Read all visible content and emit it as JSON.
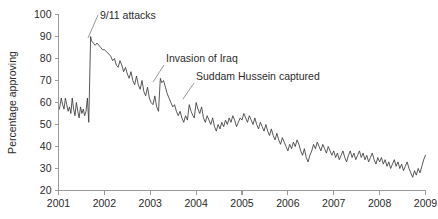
{
  "figure": {
    "width": 438,
    "height": 219,
    "background": "#ffffff"
  },
  "chart_data": {
    "type": "line",
    "title": "",
    "xlabel": "",
    "ylabel": "Percentage approving",
    "xlim": [
      2001.0,
      2009.0
    ],
    "ylim": [
      20,
      100
    ],
    "grid": false,
    "legend": null,
    "line_color": "#3b3b3b",
    "axis_color": "#9a9a9a",
    "text_color": "#2b2b2b",
    "y_ticks": [
      20,
      30,
      40,
      50,
      60,
      70,
      80,
      90,
      100
    ],
    "y_tick_labels": [
      "20",
      "30",
      "40",
      "50",
      "60",
      "70",
      "80",
      "90",
      "100"
    ],
    "x_ticks": [
      2001,
      2002,
      2003,
      2004,
      2005,
      2006,
      2007,
      2008,
      2009
    ],
    "x_tick_labels": [
      "2001",
      "2002",
      "2003",
      "2004",
      "2005",
      "2006",
      "2007",
      "2008",
      "2009"
    ],
    "annotations": [
      {
        "id": "sept-eleven",
        "label": "9/11 attacks",
        "text_x": 100,
        "text_y": 19,
        "leader": [
          [
            98,
            15
          ],
          [
            88,
            38
          ]
        ]
      },
      {
        "id": "invasion-of-iraq",
        "label": "Invasion of Iraq",
        "text_x": 166,
        "text_y": 62,
        "leader": [
          [
            164,
            65
          ],
          [
            153,
            82
          ]
        ]
      },
      {
        "id": "saddam-captured",
        "label": "Suddam Hussein captured",
        "text_x": 196,
        "text_y": 80,
        "leader": [
          [
            194,
            83
          ],
          [
            183,
            99
          ]
        ]
      }
    ],
    "series": [
      {
        "name": "Presidential approval",
        "x": [
          2001.02,
          2001.06,
          2001.09,
          2001.12,
          2001.15,
          2001.18,
          2001.21,
          2001.24,
          2001.27,
          2001.3,
          2001.33,
          2001.36,
          2001.39,
          2001.42,
          2001.45,
          2001.48,
          2001.51,
          2001.54,
          2001.57,
          2001.6,
          2001.63,
          2001.66,
          2001.7,
          2001.72,
          2001.76,
          2001.8,
          2001.84,
          2001.88,
          2001.92,
          2001.96,
          2002.0,
          2002.05,
          2002.1,
          2002.14,
          2002.18,
          2002.22,
          2002.26,
          2002.3,
          2002.34,
          2002.38,
          2002.42,
          2002.46,
          2002.5,
          2002.54,
          2002.58,
          2002.62,
          2002.66,
          2002.7,
          2002.74,
          2002.78,
          2002.82,
          2002.86,
          2002.9,
          2002.94,
          2002.98,
          2003.02,
          2003.06,
          2003.1,
          2003.14,
          2003.18,
          2003.22,
          2003.25,
          2003.29,
          2003.33,
          2003.37,
          2003.41,
          2003.45,
          2003.49,
          2003.53,
          2003.57,
          2003.61,
          2003.65,
          2003.69,
          2003.73,
          2003.77,
          2003.81,
          2003.85,
          2003.89,
          2003.93,
          2003.96,
          2004.0,
          2004.04,
          2004.08,
          2004.12,
          2004.16,
          2004.2,
          2004.24,
          2004.28,
          2004.32,
          2004.36,
          2004.4,
          2004.44,
          2004.48,
          2004.52,
          2004.56,
          2004.6,
          2004.64,
          2004.68,
          2004.72,
          2004.76,
          2004.8,
          2004.84,
          2004.88,
          2004.92,
          2004.96,
          2005.0,
          2005.04,
          2005.08,
          2005.12,
          2005.16,
          2005.2,
          2005.24,
          2005.28,
          2005.32,
          2005.36,
          2005.4,
          2005.44,
          2005.48,
          2005.52,
          2005.56,
          2005.6,
          2005.64,
          2005.68,
          2005.72,
          2005.76,
          2005.8,
          2005.84,
          2005.88,
          2005.92,
          2005.96,
          2006.0,
          2006.04,
          2006.08,
          2006.12,
          2006.16,
          2006.2,
          2006.24,
          2006.28,
          2006.32,
          2006.36,
          2006.4,
          2006.44,
          2006.48,
          2006.52,
          2006.56,
          2006.6,
          2006.64,
          2006.68,
          2006.72,
          2006.76,
          2006.8,
          2006.84,
          2006.88,
          2006.92,
          2006.96,
          2007.0,
          2007.04,
          2007.08,
          2007.12,
          2007.16,
          2007.2,
          2007.24,
          2007.28,
          2007.32,
          2007.36,
          2007.4,
          2007.44,
          2007.48,
          2007.52,
          2007.56,
          2007.6,
          2007.64,
          2007.68,
          2007.72,
          2007.76,
          2007.8,
          2007.84,
          2007.88,
          2007.92,
          2007.96,
          2008.0,
          2008.04,
          2008.08,
          2008.12,
          2008.16,
          2008.2,
          2008.24,
          2008.28,
          2008.32,
          2008.36,
          2008.4,
          2008.44,
          2008.48,
          2008.52,
          2008.56,
          2008.6,
          2008.64,
          2008.68,
          2008.72,
          2008.76,
          2008.8,
          2008.84,
          2008.88,
          2008.92,
          2008.96,
          2009.0
        ],
        "y": [
          57,
          62,
          59,
          57,
          62,
          59,
          56,
          58,
          55,
          62,
          57,
          54,
          60,
          56,
          53,
          58,
          55,
          57,
          54,
          56,
          62,
          51,
          90,
          88,
          87,
          86,
          87,
          86,
          85,
          84,
          84,
          83,
          82,
          81,
          79,
          80,
          77,
          76,
          79,
          77,
          74,
          76,
          73,
          71,
          74,
          70,
          68,
          72,
          68,
          66,
          70,
          65,
          63,
          67,
          62,
          60,
          59,
          63,
          58,
          56,
          71,
          69,
          70,
          67,
          64,
          62,
          60,
          58,
          59,
          56,
          54,
          56,
          53,
          51,
          54,
          52,
          59,
          56,
          54,
          53,
          60,
          57,
          55,
          58,
          53,
          51,
          54,
          52,
          50,
          53,
          49,
          47,
          50,
          48,
          51,
          49,
          52,
          50,
          53,
          51,
          54,
          52,
          49,
          51,
          53,
          52,
          55,
          53,
          51,
          54,
          52,
          50,
          53,
          50,
          48,
          51,
          49,
          47,
          50,
          47,
          45,
          48,
          45,
          43,
          46,
          43,
          41,
          44,
          42,
          40,
          38,
          41,
          39,
          42,
          40,
          43,
          41,
          38,
          36,
          39,
          35,
          33,
          36,
          38,
          41,
          39,
          42,
          40,
          38,
          41,
          39,
          37,
          40,
          38,
          36,
          38,
          35,
          37,
          34,
          36,
          38,
          35,
          33,
          36,
          38,
          35,
          37,
          34,
          36,
          38,
          35,
          37,
          34,
          36,
          33,
          35,
          37,
          34,
          32,
          35,
          33,
          35,
          32,
          34,
          31,
          33,
          30,
          32,
          34,
          31,
          33,
          30,
          32,
          29,
          31,
          33,
          30,
          28,
          26,
          29,
          27,
          30,
          28,
          31,
          34,
          36
        ]
      }
    ]
  }
}
